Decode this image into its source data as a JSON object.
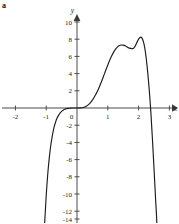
{
  "figure": {
    "part_label": "a",
    "axis_x_name": "x",
    "axis_y_name": "y"
  },
  "chart_data": {
    "type": "line",
    "title": "",
    "subtitle": "",
    "xlabel": "x",
    "ylabel": "y",
    "grid": false,
    "legend": "none",
    "annotations": [
      "a"
    ],
    "xlim": [
      -2.5,
      3.3
    ],
    "ylim": [
      -14.8,
      10.8
    ],
    "x_ticks": [
      -2,
      -1,
      0,
      1,
      2,
      3
    ],
    "x_tick_labels": [
      "-2",
      "-1",
      "0",
      "1",
      "2",
      "3"
    ],
    "y_ticks": [
      -14,
      -12,
      -10,
      -8,
      -6,
      -4,
      -2,
      0,
      2,
      4,
      6,
      8,
      10
    ],
    "y_tick_labels": [
      "-14",
      "-12",
      "-10",
      "-8",
      "-6",
      "-4",
      "-2",
      "0",
      "2",
      "4",
      "6",
      "8",
      "10"
    ],
    "series": [
      {
        "name": "curve",
        "color": "#1c1c1c",
        "x": [
          -1.08,
          -1.05,
          -1.0,
          -0.95,
          -0.9,
          -0.85,
          -0.8,
          -0.75,
          -0.7,
          -0.65,
          -0.6,
          -0.55,
          -0.5,
          -0.45,
          -0.4,
          -0.35,
          -0.3,
          -0.25,
          -0.2,
          -0.15,
          -0.1,
          -0.05,
          0.0,
          0.1,
          0.2,
          0.3,
          0.4,
          0.5,
          0.6,
          0.7,
          0.8,
          0.9,
          1.0,
          1.1,
          1.2,
          1.3,
          1.4,
          1.5,
          1.6,
          1.7,
          1.8,
          1.85,
          1.9,
          2.0,
          2.1,
          2.2,
          2.3,
          2.4,
          2.5,
          2.55,
          2.6,
          2.7,
          2.8
        ],
        "y": [
          -14.8,
          -13.4,
          -10.2,
          -7.7,
          -5.8,
          -4.3,
          -3.2,
          -2.3,
          -1.7,
          -1.2,
          -0.86,
          -0.59,
          -0.39,
          -0.25,
          -0.15,
          -0.09,
          -0.05,
          -0.03,
          -0.01,
          -0.005,
          -0.002,
          -0.0,
          0.0,
          0.008,
          0.06,
          0.21,
          0.48,
          0.91,
          1.5,
          2.24,
          3.11,
          4.06,
          5.0,
          5.86,
          6.56,
          7.05,
          7.29,
          7.31,
          7.16,
          6.96,
          6.91,
          7.0,
          7.27,
          8.0,
          8.19,
          7.0,
          4.0,
          -0.6,
          -7.0,
          -10.5,
          -14.0,
          -24.0,
          -36.0
        ],
        "description": "smooth polynomial curve through origin with inflection, local maximum near (1.85, 8.2), zero crossing near x = 2.55, steep descent on both ends"
      }
    ]
  }
}
